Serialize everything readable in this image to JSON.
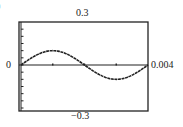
{
  "figure": {
    "partial_label": ")",
    "y_max_label": "0.3",
    "y_min_label": "−0.3",
    "x_min_label": "0",
    "x_max_label": "0.004"
  },
  "colors": {
    "line": "#222222",
    "frame": "#222222",
    "background": "#ffffff"
  },
  "chart_data": {
    "type": "line",
    "title": "",
    "xlabel": "",
    "ylabel": "",
    "xlim": [
      0,
      0.004
    ],
    "ylim": [
      -0.3,
      0.3
    ],
    "x_ticks": [
      0.001,
      0.002,
      0.003
    ],
    "y_tick_step": 0.05,
    "grid": false,
    "legend": null,
    "annotations": [
      "0.3",
      "−0.3",
      "0",
      "0.004"
    ],
    "series": [
      {
        "name": "y = 0.1 sin(500πt)",
        "x": [
          0,
          0.0005,
          0.001,
          0.0015,
          0.002,
          0.0025,
          0.003,
          0.0035,
          0.004
        ],
        "values": [
          0,
          0.071,
          0.1,
          0.071,
          0,
          -0.071,
          -0.1,
          -0.071,
          0
        ]
      }
    ]
  }
}
